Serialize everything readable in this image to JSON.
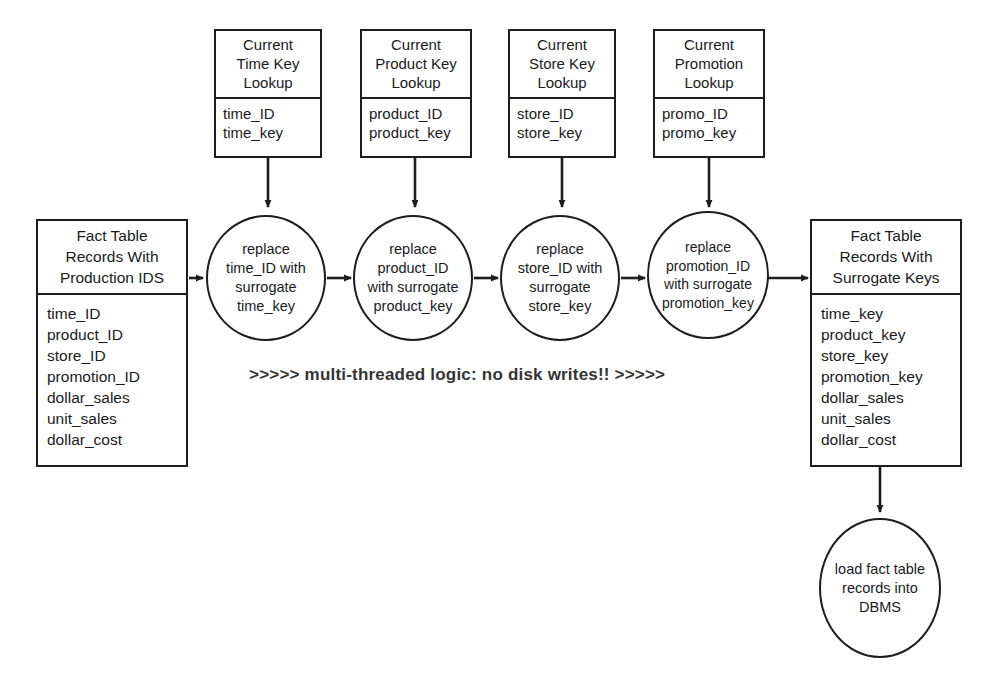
{
  "diagram": {
    "annotation": ">>>>> multi-threaded logic: no disk writes!! >>>>>",
    "stroke_color": "#1d1d1d",
    "background_color": "#ffffff",
    "annotation_color": "#343434"
  },
  "lookups": [
    {
      "id": "time-key-lookup",
      "header": [
        "Current",
        "Time Key",
        "Lookup"
      ],
      "fields": [
        "time_ID",
        "time_key"
      ]
    },
    {
      "id": "product-key-lookup",
      "header": [
        "Current",
        "Product Key",
        "Lookup"
      ],
      "fields": [
        "product_ID",
        "product_key"
      ]
    },
    {
      "id": "store-key-lookup",
      "header": [
        "Current",
        "Store Key",
        "Lookup"
      ],
      "fields": [
        "store_ID",
        "store_key"
      ]
    },
    {
      "id": "promotion-lookup",
      "header": [
        "Current",
        "Promotion",
        "Lookup"
      ],
      "fields": [
        "promo_ID",
        "promo_key"
      ]
    }
  ],
  "source_fact_table": {
    "id": "fact-table-production-ids",
    "header": [
      "Fact Table",
      "Records With",
      "Production IDS"
    ],
    "fields": [
      "time_ID",
      "product_ID",
      "store_ID",
      "promotion_ID",
      "dollar_sales",
      "unit_sales",
      "dollar_cost"
    ]
  },
  "target_fact_table": {
    "id": "fact-table-surrogate-keys",
    "header": [
      "Fact Table",
      "Records With",
      "Surrogate Keys"
    ],
    "fields": [
      "time_key",
      "product_key",
      "store_key",
      "promotion_key",
      "dollar_sales",
      "unit_sales",
      "dollar_cost"
    ]
  },
  "processes": [
    {
      "id": "replace-time-id",
      "lines": [
        "replace",
        "time_ID with",
        "surrogate",
        "time_key"
      ]
    },
    {
      "id": "replace-product-id",
      "lines": [
        "replace",
        "product_ID",
        "with surrogate",
        "product_key"
      ]
    },
    {
      "id": "replace-store-id",
      "lines": [
        "replace",
        "store_ID with",
        "surrogate",
        "store_key"
      ]
    },
    {
      "id": "replace-promotion-id",
      "lines": [
        "replace",
        "promotion_ID",
        "with surrogate",
        "promotion_key"
      ]
    }
  ],
  "load_process": {
    "id": "load-fact-table-dbms",
    "lines": [
      "load fact table",
      "records into",
      "DBMS"
    ]
  }
}
